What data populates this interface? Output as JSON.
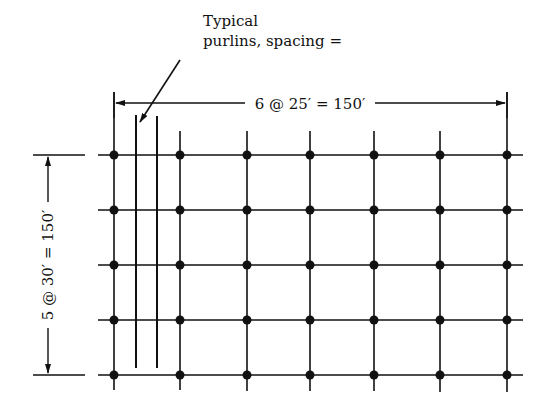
{
  "annotation": {
    "line1": "Typical",
    "line2": "purlins, spacing ="
  },
  "dimensions": {
    "horizontal": "6 @ 25′ = 150′",
    "vertical": "5 @ 30′ = 150′"
  },
  "grid": {
    "columns_x": [
      114,
      180,
      247,
      310,
      374,
      440,
      507
    ],
    "rows_y": [
      155,
      210,
      265,
      320,
      375
    ],
    "bays_horizontal": 6,
    "bay_width_ft": 25,
    "bays_vertical": 5,
    "bay_depth_ft": 30,
    "total_ft": 150
  },
  "colors": {
    "line": "#111111",
    "background": "#ffffff"
  }
}
